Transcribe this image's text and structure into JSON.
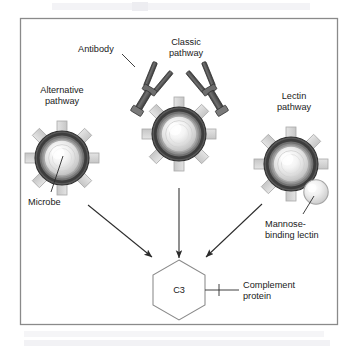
{
  "figure": {
    "frame": {
      "border_color": "#8a8a8a",
      "background": "#ffffff"
    }
  },
  "labels": {
    "antibody": "Antibody",
    "classic_pathway_line1": "Classic",
    "classic_pathway_line2": "pathway",
    "alternative_pathway_line1": "Alternative",
    "alternative_pathway_line2": "pathway",
    "lectin_pathway_line1": "Lectin",
    "lectin_pathway_line2": "pathway",
    "microbe": "Microbe",
    "mannose_line1": "Mannose-",
    "mannose_line2": "binding lectin",
    "c3": "C3",
    "complement_line1": "Complement",
    "complement_line2": "protein"
  },
  "elements": {
    "microbes": [
      {
        "name": "alternative-pathway-microbe",
        "cx": 62,
        "cy": 158,
        "r": 27
      },
      {
        "name": "classic-pathway-microbe",
        "cx": 179,
        "cy": 134,
        "r": 27
      },
      {
        "name": "lectin-pathway-microbe",
        "cx": 291,
        "cy": 164,
        "r": 27
      }
    ],
    "antibodies": [
      {
        "name": "antibody-left",
        "x": 140,
        "y": 95
      },
      {
        "name": "antibody-right",
        "x": 218,
        "y": 95
      }
    ],
    "mannose_sphere": {
      "name": "mannose-binding-lectin-sphere",
      "cx": 316,
      "cy": 192,
      "r": 12
    },
    "c3_hexagon": {
      "name": "c3-complement-hexagon",
      "cx": 179,
      "cy": 290,
      "rx": 26,
      "ry": 30
    },
    "arrows": [
      {
        "name": "arrow-alternative-to-c3",
        "x1": 88,
        "y1": 205,
        "x2": 152,
        "y2": 257
      },
      {
        "name": "arrow-classic-to-c3",
        "x1": 179,
        "y1": 190,
        "x2": 179,
        "y2": 257
      },
      {
        "name": "arrow-lectin-to-c3",
        "x1": 262,
        "y1": 204,
        "x2": 206,
        "y2": 257
      }
    ]
  },
  "colors": {
    "microbe_ring_dark": "#4f4f4f",
    "microbe_ring_mid": "#8d8d8d",
    "microbe_core_light": "#fbfbfb",
    "spike_fill": "#d5d5d5",
    "spike_stroke": "#a8a8a8",
    "antibody_dark": "#4a4a4a",
    "antibody_light": "#9a9a9a",
    "lectin_sphere_light": "#f2f2f2",
    "lectin_sphere_edge": "#b4b4b4",
    "line_color": "#333333",
    "text_color": "#1a1a1a"
  },
  "scan_artifacts": {
    "top_ghost": "faint bleed-through text above frame",
    "bottom_ghost": "faint bleed-through text below frame"
  }
}
